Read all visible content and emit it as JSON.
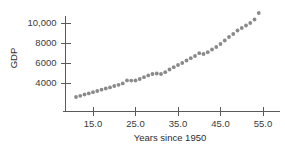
{
  "chart_data": {
    "type": "scatter",
    "title": "",
    "xlabel": "Years since 1950",
    "ylabel": "GDP",
    "xlim": [
      9,
      56
    ],
    "ylim": [
      2000,
      11600
    ],
    "grid": false,
    "legend": null,
    "marker_color": "#8a8a8a",
    "axis_color": "#5a5a5a",
    "xticks": [
      15.0,
      25.0,
      35.0,
      45.0,
      55.0
    ],
    "xtick_labels": [
      "15.0",
      "25.0",
      "35.0",
      "45.0",
      "55.0"
    ],
    "yticks": [
      4000,
      6000,
      8000,
      10000
    ],
    "ytick_labels": [
      "4000",
      "6000",
      "8000",
      "10,000"
    ],
    "x": [
      11,
      12,
      13,
      14,
      15,
      16,
      17,
      18,
      19,
      20,
      21,
      22,
      23,
      24,
      25,
      26,
      27,
      28,
      29,
      30,
      31,
      32,
      33,
      34,
      35,
      36,
      37,
      38,
      39,
      40,
      41,
      42,
      43,
      44,
      45,
      46,
      47,
      48,
      49,
      50,
      51,
      52,
      53,
      54
    ],
    "values": [
      2600,
      2720,
      2850,
      2960,
      3080,
      3200,
      3330,
      3450,
      3560,
      3700,
      3820,
      3960,
      4260,
      4240,
      4250,
      4400,
      4580,
      4760,
      4900,
      4950,
      4900,
      5080,
      5350,
      5580,
      5800,
      6000,
      6250,
      6480,
      6700,
      6980,
      6900,
      7080,
      7350,
      7600,
      7900,
      8250,
      8600,
      8900,
      9250,
      9500,
      9750,
      10000,
      10350,
      11000
    ]
  },
  "axis_titles": {
    "x": "Years since 1950",
    "y": "GDP"
  }
}
